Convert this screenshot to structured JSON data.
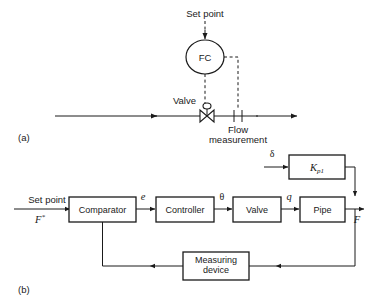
{
  "figure": {
    "panel_a": {
      "caption": "(a)",
      "set_point_label": "Set point",
      "controller_label": "FC",
      "valve_label": "Valve",
      "flow_measurement_line1": "Flow",
      "flow_measurement_line2": "measurement"
    },
    "panel_b": {
      "caption": "(b)",
      "set_point_label": "Set point",
      "set_point_symbol": "F",
      "set_point_symbol_sup": "*",
      "disturbance_symbol": "δ",
      "gain_block_symbol": "K",
      "gain_block_subscript": "p1",
      "error_symbol": "e",
      "controller_output_symbol": "θ",
      "valve_output_symbol": "q",
      "process_output_symbol": "F",
      "blocks": [
        {
          "name": "comparator",
          "label": "Comparator"
        },
        {
          "name": "controller",
          "label": "Controller"
        },
        {
          "name": "valve",
          "label": "Valve"
        },
        {
          "name": "pipe",
          "label": "Pipe"
        },
        {
          "name": "measuring-device",
          "label_line1": "Measuring",
          "label_line2": "device"
        }
      ]
    }
  },
  "colors": {
    "ink": "#1a1a1a",
    "paper": "#ffffff"
  }
}
